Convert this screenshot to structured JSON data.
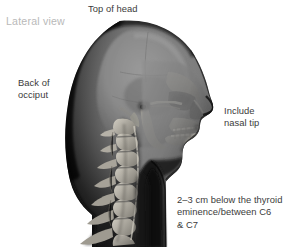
{
  "figure": {
    "view_label": "Lateral view",
    "background_color": "#ffffff",
    "label_color": "#3b3b3b",
    "muted_label_color": "#b9b9b9"
  },
  "annotations": [
    {
      "id": "top-of-head",
      "text": "Top of head"
    },
    {
      "id": "back-of-occiput",
      "text": "Back of\nocciput"
    },
    {
      "id": "include-nasal-tip",
      "text": "Include\nnasal tip"
    },
    {
      "id": "thyroid-landmark",
      "text": "2–3 cm below the thyroid\neminence/between C6\n& C7"
    }
  ]
}
